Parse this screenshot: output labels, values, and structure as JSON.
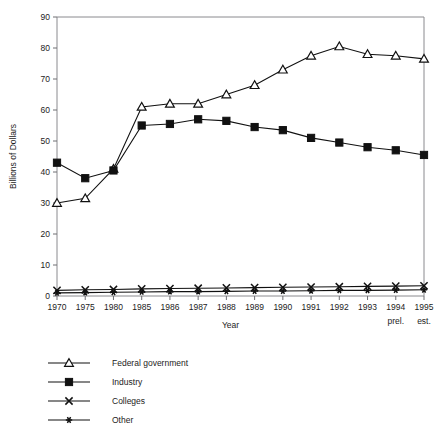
{
  "figure": {
    "clipped_header_text": "",
    "ylabel": "Billions of Dollars",
    "xlabel": "Year"
  },
  "chart_data": {
    "type": "line",
    "title": "",
    "xlabel": "Year",
    "ylabel": "Billions of Dollars",
    "ylim": [
      0,
      90
    ],
    "yticks": [
      0,
      10,
      20,
      30,
      40,
      50,
      60,
      70,
      80,
      90
    ],
    "grid": false,
    "legend_position": "below-left",
    "categories": [
      "1970",
      "1975",
      "1980",
      "1985",
      "1986",
      "1987",
      "1988",
      "1989",
      "1990",
      "1991",
      "1992",
      "1993",
      "1994",
      "1995"
    ],
    "category_notes": [
      "",
      "",
      "",
      "",
      "",
      "",
      "",
      "",
      "",
      "",
      "",
      "",
      "prel.",
      "est."
    ],
    "series": [
      {
        "name": "Federal government",
        "marker": "open-triangle",
        "values": [
          30,
          31.5,
          41,
          61,
          62,
          62,
          65,
          68,
          73,
          77.5,
          80.5,
          78,
          77.5,
          76.5
        ]
      },
      {
        "name": "Industry",
        "marker": "filled-square",
        "values": [
          43,
          38,
          40.5,
          55,
          55.5,
          57,
          56.5,
          54.5,
          53.5,
          51,
          49.5,
          48,
          47,
          45.5
        ]
      },
      {
        "name": "Colleges",
        "marker": "x-cross",
        "values": [
          1.8,
          2.0,
          2.1,
          2.3,
          2.4,
          2.5,
          2.6,
          2.7,
          2.8,
          2.9,
          3.0,
          3.1,
          3.2,
          3.3
        ]
      },
      {
        "name": "Other",
        "marker": "small-star",
        "values": [
          1.0,
          1.1,
          1.2,
          1.3,
          1.4,
          1.4,
          1.5,
          1.6,
          1.6,
          1.7,
          1.8,
          1.8,
          1.9,
          2.0
        ]
      }
    ]
  },
  "legend": {
    "items": [
      {
        "label": "Federal government",
        "marker": "open-triangle"
      },
      {
        "label": "Industry",
        "marker": "filled-square"
      },
      {
        "label": "Colleges",
        "marker": "x-cross"
      },
      {
        "label": "Other",
        "marker": "small-star"
      }
    ]
  }
}
